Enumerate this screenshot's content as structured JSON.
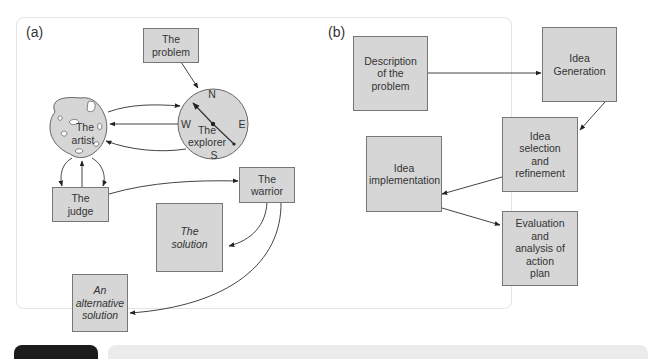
{
  "panel_a": {
    "label": "(a)",
    "nodes": {
      "problem": "The problem",
      "artist": [
        "The",
        "artist"
      ],
      "explorer": [
        "The",
        "explorer"
      ],
      "judge": "The judge",
      "warrior": "The warrior",
      "solution": "The solution",
      "alternative": "An alternative solution"
    },
    "compass": {
      "n": "N",
      "s": "S",
      "e": "E",
      "w": "W"
    }
  },
  "panel_b": {
    "label": "(b)",
    "nodes": {
      "description": "Description of the problem",
      "generation": "Idea Generation",
      "selection": "Idea selection and refinement",
      "implementation": "Idea implementation",
      "evaluation": "Evaluation and analysis of action plan"
    }
  },
  "colors": {
    "box_fill": "#d6d6d6",
    "box_border": "#777777",
    "arrow": "#333333",
    "bottom_dark": "#1c1c1c",
    "bottom_light": "#ebebeb"
  }
}
